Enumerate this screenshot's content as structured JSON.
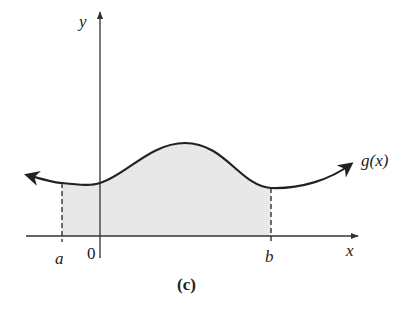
{
  "figure": {
    "caption": "(c)",
    "function_label": "g(x)",
    "axis_labels": {
      "x": "x",
      "y": "y"
    },
    "tick_labels": {
      "a": "a",
      "origin": "0",
      "b": "b"
    },
    "shaded_region": "area under g(x) from a to b",
    "colors": {
      "curve": "#222222",
      "shade": "#e8e8e8",
      "axis": "#333333"
    }
  }
}
